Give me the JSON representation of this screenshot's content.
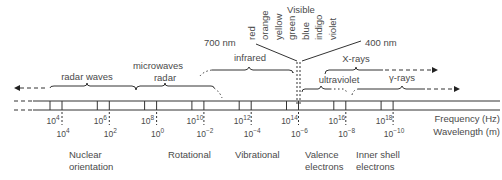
{
  "diagram": {
    "axes": {
      "frequency_label": "Frequency (Hz)",
      "wavelength_label": "Wavelength (m)",
      "frequency_ticks": [
        {
          "base": "10",
          "exp": "4"
        },
        {
          "base": "10",
          "exp": "6"
        },
        {
          "base": "10",
          "exp": "8"
        },
        {
          "base": "10",
          "exp": "10"
        },
        {
          "base": "10",
          "exp": "12"
        },
        {
          "base": "10",
          "exp": "14"
        },
        {
          "base": "10",
          "exp": "16"
        },
        {
          "base": "10",
          "exp": "18"
        }
      ],
      "wavelength_ticks": [
        {
          "base": "10",
          "exp": "4"
        },
        {
          "base": "10",
          "exp": "2"
        },
        {
          "base": "10",
          "exp": "0"
        },
        {
          "base": "10",
          "exp": "−2"
        },
        {
          "base": "10",
          "exp": "−4"
        },
        {
          "base": "10",
          "exp": "−6"
        },
        {
          "base": "10",
          "exp": "−8"
        },
        {
          "base": "10",
          "exp": "−10"
        }
      ]
    },
    "regions": {
      "radar_waves": "radar waves",
      "microwaves": "microwaves",
      "radar": "radar",
      "infrared": "infrared",
      "ultraviolet": "ultraviolet",
      "x_rays": "X-rays",
      "gamma_rays": "γ-rays"
    },
    "visible": {
      "title": "Visible",
      "colors": [
        "red",
        "orange",
        "yellow",
        "green",
        "blue",
        "indigo",
        "violet"
      ],
      "long_end": "700 nm",
      "short_end": "400 nm"
    },
    "transitions": [
      {
        "line1": "Nuclear",
        "line2": "orientation"
      },
      {
        "line1": "Rotational",
        "line2": ""
      },
      {
        "line1": "Vibrational",
        "line2": ""
      },
      {
        "line1": "Valence",
        "line2": "electrons"
      },
      {
        "line1": "Inner shell",
        "line2": "electrons"
      }
    ]
  }
}
